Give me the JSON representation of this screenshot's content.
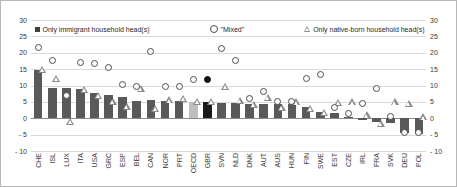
{
  "legend": {
    "items": [
      {
        "label": "Only immigrant household head(s)",
        "marker": "square-marker",
        "color": "#404040"
      },
      {
        "label": "\"Mixed\"",
        "marker": "circle-marker",
        "color": "#4d4d4d"
      },
      {
        "label": "Only native-born household head(s)",
        "marker": "triangle-marker",
        "color": "#8a8a8a"
      }
    ]
  },
  "axes": {
    "y_ticks": [
      "30",
      "25",
      "20",
      "15",
      "10",
      "5",
      "0",
      "- 5",
      "- 10"
    ],
    "y_tick_values": [
      30,
      25,
      20,
      15,
      10,
      5,
      0,
      -5,
      -10
    ]
  },
  "chart_data": {
    "type": "bar",
    "title": "",
    "xlabel": "",
    "ylabel": "",
    "ylim": [
      -10,
      30
    ],
    "grid": true,
    "legend_position": "top",
    "categories": [
      "CHE",
      "ISL",
      "LUX",
      "ITA",
      "USA",
      "GRC",
      "ESP",
      "BEL",
      "CAN",
      "NOR",
      "PRT",
      "OECD",
      "GBR",
      "SVN",
      "NLD",
      "DNK",
      "AUT",
      "AUS",
      "HUN",
      "FIN",
      "SWE",
      "EST",
      "CZE",
      "IRL",
      "FRA",
      "SVK",
      "DEU",
      "POL"
    ],
    "series": [
      {
        "name": "Only immigrant household head(s)",
        "type": "bar",
        "values": [
          14.6,
          9.2,
          9.2,
          8.8,
          7.6,
          7.0,
          6.5,
          5.4,
          5.6,
          5.2,
          5.3,
          5.0,
          5.0,
          4.6,
          4.6,
          4.3,
          4.2,
          4.3,
          4.4,
          3.5,
          2.0,
          1.6,
          0.3,
          -0.4,
          -1.2,
          -1.4,
          -4.6,
          -4.8
        ]
      },
      {
        "name": "\"Mixed\"",
        "type": "scatter",
        "values": [
          21.5,
          17.6,
          7.0,
          17.1,
          16.8,
          15.4,
          10.2,
          9.7,
          20.4,
          9.6,
          9.7,
          11.8,
          11.8,
          21.2,
          17.6,
          6.0,
          8.1,
          5.2,
          5.1,
          12.1,
          13.3,
          3.3,
          1.5,
          4.6,
          9.0,
          0.6,
          -4.3,
          -4.4
        ]
      },
      {
        "name": "Only native-born household head(s)",
        "type": "scatter",
        "values": [
          15.0,
          12.1,
          -1.0,
          8.8,
          7.0,
          5.1,
          3.6,
          9.0,
          3.0,
          5.6,
          6.0,
          5.2,
          5.2,
          9.6,
          5.4,
          4.3,
          6.4,
          3.4,
          5.0,
          3.0,
          1.7,
          4.8,
          5.0,
          1.0,
          -1.5,
          5.0,
          4.5,
          0.4
        ]
      }
    ],
    "highlight": {
      "category": "GBR",
      "bar_color": "#1a1a1a",
      "circle_filled": true
    },
    "oecd_bar_color": "#bfbfbf"
  }
}
